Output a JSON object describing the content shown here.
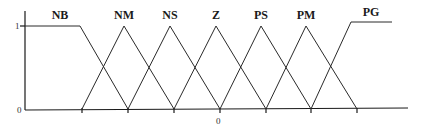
{
  "diagram": {
    "type": "fuzzy-membership-functions",
    "y_axis": {
      "tick_top": "1",
      "tick_bottom": "0"
    },
    "x_axis": {
      "center_label": "0"
    },
    "sets": [
      {
        "name": "NB",
        "shape": "trapezoid-left",
        "points": [
          [
            25,
            26
          ],
          [
            80,
            26
          ],
          [
            128,
            109
          ]
        ],
        "label_x": 60
      },
      {
        "name": "NM",
        "shape": "triangle",
        "points": [
          [
            82,
            109
          ],
          [
            124,
            26
          ],
          [
            174,
            109
          ]
        ],
        "label_x": 124
      },
      {
        "name": "NS",
        "shape": "triangle",
        "points": [
          [
            128,
            109
          ],
          [
            170,
            26
          ],
          [
            220,
            109
          ]
        ],
        "label_x": 170
      },
      {
        "name": "Z",
        "shape": "triangle",
        "points": [
          [
            174,
            109
          ],
          [
            216,
            26
          ],
          [
            266,
            109
          ]
        ],
        "label_x": 216
      },
      {
        "name": "PS",
        "shape": "triangle",
        "points": [
          [
            220,
            109
          ],
          [
            261,
            26
          ],
          [
            311,
            109
          ]
        ],
        "label_x": 261
      },
      {
        "name": "PM",
        "shape": "triangle",
        "points": [
          [
            266,
            109
          ],
          [
            306,
            26
          ],
          [
            357,
            109
          ]
        ],
        "label_x": 306
      },
      {
        "name": "PG",
        "shape": "trapezoid-right",
        "points": [
          [
            311,
            109
          ],
          [
            351,
            22
          ],
          [
            392,
            22
          ]
        ],
        "label_x": 371
      }
    ],
    "ticks_x": [
      82,
      128,
      174,
      220,
      266,
      311,
      357
    ],
    "colors": {
      "line": "#2a2a2a",
      "background": "#ffffff"
    }
  }
}
